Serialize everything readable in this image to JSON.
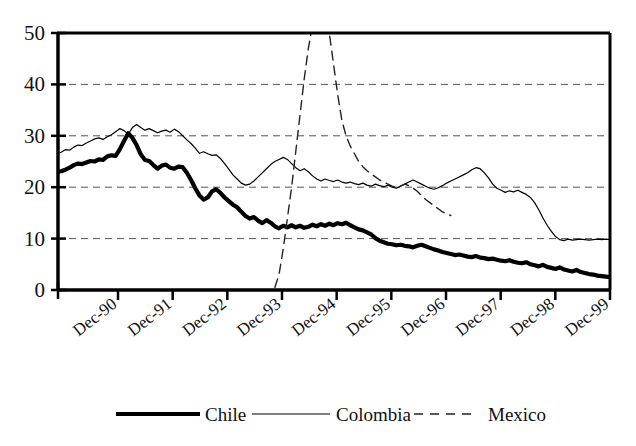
{
  "chart_data": {
    "type": "line",
    "title": "",
    "xlabel": "",
    "ylabel": "",
    "ylim": [
      0,
      50
    ],
    "yticks": [
      0,
      10,
      20,
      30,
      40,
      50
    ],
    "grid": "horizontal-dashed",
    "legend_position": "bottom",
    "x_tick_labels": [
      "Dec-90",
      "Dec-91",
      "Dec-92",
      "Dec-93",
      "Dec-94",
      "Dec-95",
      "Dec-96",
      "Dec-97",
      "Dec-98",
      "Dec-99"
    ],
    "x_range_note": "monthly observations from mid-1990 through late-1999",
    "series": [
      {
        "name": "Chile",
        "style": "thick-solid",
        "color": "#000000",
        "width": 4.2,
        "values": [
          23.0,
          23.1,
          23.4,
          23.8,
          24.3,
          24.6,
          24.5,
          24.8,
          25.1,
          25.0,
          25.4,
          25.3,
          26.0,
          26.2,
          26.1,
          27.4,
          29.0,
          30.5,
          29.6,
          28.2,
          26.4,
          25.3,
          25.1,
          24.3,
          23.6,
          24.2,
          24.4,
          23.8,
          23.6,
          24.0,
          23.9,
          22.8,
          21.4,
          19.8,
          18.4,
          17.6,
          18.0,
          19.2,
          19.6,
          18.9,
          18.0,
          17.3,
          16.6,
          16.1,
          15.2,
          14.4,
          13.9,
          14.2,
          13.5,
          13.0,
          13.6,
          13.1,
          12.4,
          12.0,
          12.5,
          12.2,
          12.6,
          12.2,
          12.5,
          12.1,
          12.3,
          12.7,
          12.4,
          12.8,
          12.5,
          12.9,
          12.6,
          13.0,
          12.8,
          13.1,
          12.6,
          12.2,
          11.8,
          11.6,
          11.2,
          10.8,
          10.1,
          9.6,
          9.3,
          9.0,
          8.9,
          8.7,
          8.8,
          8.6,
          8.5,
          8.3,
          8.6,
          8.8,
          8.5,
          8.2,
          7.9,
          7.7,
          7.4,
          7.2,
          7.0,
          6.8,
          6.9,
          6.7,
          6.5,
          6.4,
          6.6,
          6.3,
          6.2,
          6.0,
          6.1,
          5.9,
          5.7,
          5.6,
          5.8,
          5.5,
          5.3,
          5.2,
          5.4,
          5.0,
          4.8,
          4.6,
          4.9,
          4.5,
          4.3,
          4.1,
          4.4,
          4.0,
          3.8,
          3.6,
          3.9,
          3.5,
          3.3,
          3.1,
          3.0,
          2.8,
          2.7,
          2.6,
          2.5
        ]
      },
      {
        "name": "Colombia",
        "style": "thin-solid",
        "color": "#000000",
        "width": 1.2,
        "values": [
          26.5,
          26.8,
          27.3,
          27.2,
          27.8,
          28.2,
          28.1,
          28.6,
          29.0,
          29.4,
          29.6,
          29.3,
          29.8,
          30.2,
          30.8,
          31.4,
          31.0,
          30.3,
          31.6,
          32.2,
          31.6,
          31.1,
          31.4,
          31.0,
          30.6,
          30.9,
          31.1,
          30.7,
          31.3,
          30.8,
          30.0,
          29.2,
          28.5,
          27.6,
          26.6,
          26.9,
          26.5,
          26.2,
          26.3,
          25.6,
          24.6,
          23.5,
          22.4,
          21.6,
          20.8,
          20.4,
          20.6,
          21.2,
          22.0,
          22.8,
          23.6,
          24.4,
          25.0,
          25.4,
          25.8,
          25.4,
          24.6,
          23.8,
          23.2,
          23.6,
          23.0,
          22.2,
          21.6,
          21.2,
          21.6,
          21.3,
          21.1,
          21.4,
          21.0,
          20.8,
          21.0,
          20.7,
          20.5,
          20.8,
          20.4,
          20.2,
          20.6,
          20.3,
          20.1,
          20.4,
          20.0,
          19.8,
          20.2,
          20.6,
          21.0,
          21.4,
          21.0,
          20.6,
          20.2,
          19.8,
          19.6,
          19.9,
          20.3,
          20.8,
          21.2,
          21.6,
          22.0,
          22.4,
          22.8,
          23.4,
          23.8,
          23.6,
          22.8,
          21.8,
          20.6,
          19.8,
          19.4,
          19.0,
          19.3,
          19.1,
          19.4,
          19.0,
          18.6,
          18.0,
          17.0,
          15.6,
          14.0,
          12.6,
          11.4,
          10.4,
          9.8,
          9.6,
          9.9,
          9.7,
          9.8,
          9.9,
          9.8,
          9.7,
          9.8,
          9.9,
          9.8,
          9.9,
          9.8
        ]
      },
      {
        "name": "Mexico",
        "style": "dashed",
        "color": "#222222",
        "width": 1.4,
        "note": "line exits top of axis (values above 50) near Dec-95, then returns; series ends around Dec-97",
        "x_start_index": 52,
        "values": [
          0.5,
          3.0,
          8.0,
          14.0,
          20.0,
          27.0,
          34.0,
          41.0,
          47.0,
          51.5,
          56.0,
          58.0,
          55.0,
          50.0,
          44.0,
          38.0,
          33.0,
          30.0,
          28.0,
          26.5,
          25.0,
          24.0,
          23.2,
          22.6,
          22.0,
          21.4,
          21.0,
          20.6,
          20.2,
          20.0,
          20.2,
          20.6,
          20.3,
          19.8,
          19.2,
          18.4,
          17.6,
          17.0,
          16.4,
          15.8,
          15.2,
          14.8,
          14.5
        ]
      }
    ]
  },
  "axes": {
    "y_tick_labels": [
      "50",
      "40",
      "30",
      "20",
      "10",
      "0"
    ]
  },
  "legend": {
    "items": [
      {
        "label": "Chile",
        "marker": "thick-solid-line"
      },
      {
        "label": "Colombia",
        "marker": "thin-solid-line"
      },
      {
        "label": "Mexico",
        "marker": "dashed-line"
      }
    ]
  }
}
